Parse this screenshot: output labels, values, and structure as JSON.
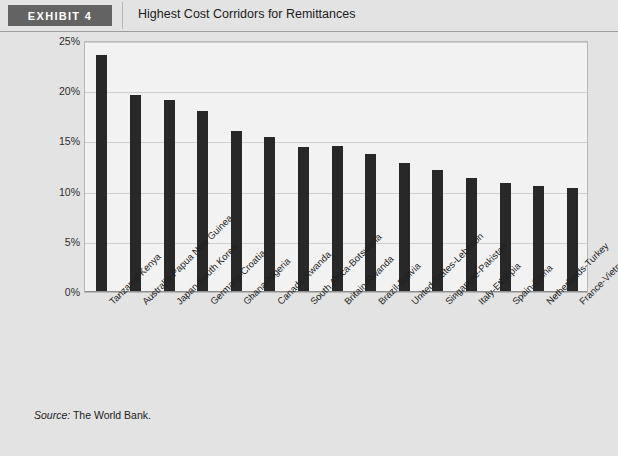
{
  "header": {
    "badge_label": "EXHIBIT 4",
    "title": "Highest Cost Corridors for Remittances"
  },
  "source": {
    "keyword": "Source:",
    "text": " The World Bank."
  },
  "colors": {
    "bar": "#282828",
    "badge_bg": "#636363",
    "page_bg": "#e3e3e3",
    "plot_bg": "#f2f2f2",
    "gridline": "#cfcfcf"
  },
  "chart_data": {
    "type": "bar",
    "title": "Highest Cost Corridors for Remittances",
    "xlabel": "",
    "ylabel": "",
    "ylim": [
      0,
      25
    ],
    "ytick_labels": [
      "0%",
      "5%",
      "10%",
      "15%",
      "20%",
      "25%"
    ],
    "yticks": [
      0,
      5,
      10,
      15,
      20,
      25
    ],
    "grid": true,
    "legend": "none",
    "categories": [
      "Tanzania-Kenya",
      "Australia-Papua New Guinea",
      "Japan-South Korea",
      "Germany-Croatia",
      "Ghana-Nigeria",
      "Canada-Rwanda",
      "South Africa-Botswana",
      "Britain-Rwanda",
      "Brazil-Bolivia",
      "United States-Lebanon",
      "Singapore-Pakistan",
      "Italy-Ethiopia",
      "Spain-China",
      "Netherlands-Turkey",
      "France-Vietnam"
    ],
    "values": [
      23.5,
      19.5,
      19.0,
      17.9,
      15.9,
      15.3,
      14.3,
      14.4,
      13.6,
      12.8,
      12.1,
      11.3,
      10.8,
      10.5,
      10.3
    ]
  }
}
